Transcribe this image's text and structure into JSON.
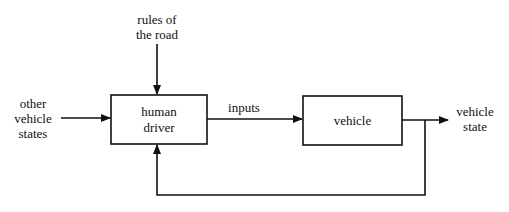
{
  "diagram": {
    "type": "block-diagram",
    "colors": {
      "stroke": "#111111",
      "background": "#ffffff"
    },
    "blocks": [
      {
        "id": "human-driver",
        "label_line1": "human",
        "label_line2": "driver"
      },
      {
        "id": "vehicle",
        "label": "vehicle"
      }
    ],
    "inputs": {
      "rules": {
        "line1": "rules of",
        "line2": "the road"
      },
      "other_states": {
        "line1": "other",
        "line2": "vehicle",
        "line3": "states"
      }
    },
    "edges": {
      "inputs_label": "inputs"
    },
    "output": {
      "line1": "vehicle",
      "line2": "state"
    },
    "connections": [
      {
        "from": "rules of the road",
        "to": "human driver"
      },
      {
        "from": "other vehicle states",
        "to": "human driver"
      },
      {
        "from": "human driver",
        "to": "vehicle",
        "label": "inputs"
      },
      {
        "from": "vehicle",
        "to": "vehicle state"
      },
      {
        "from": "vehicle state",
        "to": "human driver",
        "label": "feedback"
      }
    ]
  }
}
